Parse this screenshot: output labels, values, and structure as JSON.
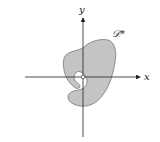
{
  "figure": {
    "region_label": "𝒟*",
    "x_axis_label": "x",
    "y_axis_label": "y",
    "colors": {
      "region_fill": "#c4c4c4",
      "region_stroke": "#555555",
      "axis": "#222222",
      "origin_hole": "#ffffff"
    }
  }
}
